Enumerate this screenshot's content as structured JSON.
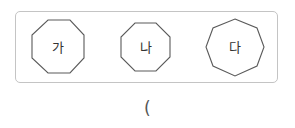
{
  "figure": {
    "shapes": [
      {
        "label": "가",
        "type": "octagon",
        "orientation": "flat-top"
      },
      {
        "label": "나",
        "type": "octagon",
        "orientation": "flat-top"
      },
      {
        "label": "다",
        "type": "octagon",
        "orientation": "vertex-top"
      }
    ],
    "stroke_color": "#5a5a5a",
    "frame_color": "#c4c4c4"
  },
  "answer": {
    "open_paren": "("
  }
}
